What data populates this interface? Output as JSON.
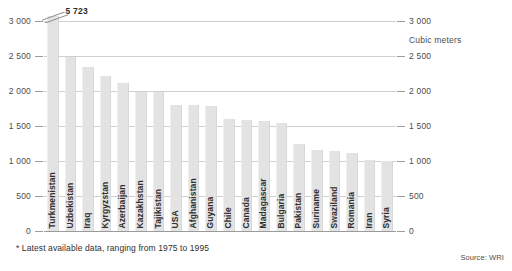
{
  "chart_data": {
    "type": "bar",
    "title": "",
    "subtitle": "",
    "xlabel": "",
    "ylabel": "Cubic meters",
    "ylim": [
      0,
      3000
    ],
    "grid": true,
    "legend": "none",
    "axis_side": "both",
    "yticks": [
      "0",
      "500",
      "1 000",
      "1 500",
      "2 000",
      "2 500",
      "3 000"
    ],
    "ytick_values": [
      0,
      500,
      1000,
      1500,
      2000,
      2500,
      3000
    ],
    "categories": [
      "Turkmenistan",
      "Uzbekistan",
      "Iraq",
      "Kyrgyzstan",
      "Azerbaijan",
      "Kazakhstan",
      "Tajikistan",
      "USA",
      "Afghanistan",
      "Guyana",
      "Chile",
      "Canada",
      "Madagascar",
      "Bulgaria",
      "Pakistan",
      "Suriname",
      "Swaziland",
      "Romania",
      "Iran",
      "Syria"
    ],
    "values": [
      5723,
      2480,
      2340,
      2210,
      2110,
      1990,
      1980,
      1800,
      1795,
      1790,
      1600,
      1590,
      1570,
      1550,
      1240,
      1160,
      1140,
      1110,
      1020,
      1000
    ],
    "truncated_bar_index": 0,
    "truncated_bar_label": "5 723",
    "bar_color": "#e3e3e3",
    "gridline_color": "#cfcfcf",
    "axis_color": "#9a9a9a",
    "annotations": {
      "units": "Cubic meters",
      "footnote": "* Latest available data, ranging from 1975 to 1995",
      "source": "Source: WRI"
    }
  }
}
